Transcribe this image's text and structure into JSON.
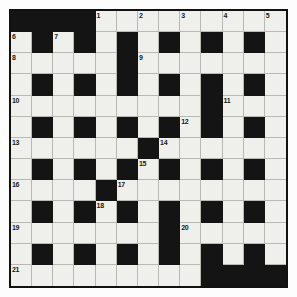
{
  "puzzle": {
    "title": "Crossword Grid",
    "rows": 13,
    "columns": 13,
    "colors": {
      "page_background": "#ffffff",
      "cell_fill": "#efefec",
      "block_fill": "#141414",
      "grid_line": "#b9b9b4",
      "border": "#111111",
      "number_text": "#1a1a1a"
    },
    "legend": {
      "open_cell": "white",
      "blocked_cell": "black"
    },
    "clue_numbers": [
      1,
      2,
      3,
      4,
      5,
      6,
      7,
      8,
      9,
      10,
      11,
      12,
      13,
      14,
      15,
      16,
      17,
      18,
      19,
      20,
      21
    ],
    "grid": [
      [
        {
          "block": true,
          "num": ""
        },
        {
          "block": true,
          "num": ""
        },
        {
          "block": true,
          "num": ""
        },
        {
          "block": true,
          "num": ""
        },
        {
          "block": false,
          "num": "1"
        },
        {
          "block": false,
          "num": ""
        },
        {
          "block": false,
          "num": "2"
        },
        {
          "block": false,
          "num": ""
        },
        {
          "block": false,
          "num": "3"
        },
        {
          "block": false,
          "num": ""
        },
        {
          "block": false,
          "num": "4"
        },
        {
          "block": false,
          "num": ""
        },
        {
          "block": false,
          "num": "5"
        }
      ],
      [
        {
          "block": false,
          "num": "6"
        },
        {
          "block": true,
          "num": ""
        },
        {
          "block": false,
          "num": "7"
        },
        {
          "block": true,
          "num": ""
        },
        {
          "block": false,
          "num": ""
        },
        {
          "block": true,
          "num": ""
        },
        {
          "block": false,
          "num": ""
        },
        {
          "block": true,
          "num": ""
        },
        {
          "block": false,
          "num": ""
        },
        {
          "block": true,
          "num": ""
        },
        {
          "block": false,
          "num": ""
        },
        {
          "block": true,
          "num": ""
        },
        {
          "block": false,
          "num": ""
        }
      ],
      [
        {
          "block": false,
          "num": "8"
        },
        {
          "block": false,
          "num": ""
        },
        {
          "block": false,
          "num": ""
        },
        {
          "block": false,
          "num": ""
        },
        {
          "block": false,
          "num": ""
        },
        {
          "block": true,
          "num": ""
        },
        {
          "block": false,
          "num": "9"
        },
        {
          "block": false,
          "num": ""
        },
        {
          "block": false,
          "num": ""
        },
        {
          "block": false,
          "num": ""
        },
        {
          "block": false,
          "num": ""
        },
        {
          "block": false,
          "num": ""
        },
        {
          "block": false,
          "num": ""
        }
      ],
      [
        {
          "block": false,
          "num": ""
        },
        {
          "block": true,
          "num": ""
        },
        {
          "block": false,
          "num": ""
        },
        {
          "block": true,
          "num": ""
        },
        {
          "block": false,
          "num": ""
        },
        {
          "block": true,
          "num": ""
        },
        {
          "block": false,
          "num": ""
        },
        {
          "block": true,
          "num": ""
        },
        {
          "block": false,
          "num": ""
        },
        {
          "block": true,
          "num": ""
        },
        {
          "block": false,
          "num": ""
        },
        {
          "block": true,
          "num": ""
        },
        {
          "block": false,
          "num": ""
        }
      ],
      [
        {
          "block": false,
          "num": "10"
        },
        {
          "block": false,
          "num": ""
        },
        {
          "block": false,
          "num": ""
        },
        {
          "block": false,
          "num": ""
        },
        {
          "block": false,
          "num": ""
        },
        {
          "block": false,
          "num": ""
        },
        {
          "block": false,
          "num": ""
        },
        {
          "block": false,
          "num": ""
        },
        {
          "block": false,
          "num": ""
        },
        {
          "block": true,
          "num": ""
        },
        {
          "block": false,
          "num": "11"
        },
        {
          "block": false,
          "num": ""
        },
        {
          "block": false,
          "num": ""
        }
      ],
      [
        {
          "block": false,
          "num": ""
        },
        {
          "block": true,
          "num": ""
        },
        {
          "block": false,
          "num": ""
        },
        {
          "block": true,
          "num": ""
        },
        {
          "block": false,
          "num": ""
        },
        {
          "block": true,
          "num": ""
        },
        {
          "block": false,
          "num": ""
        },
        {
          "block": true,
          "num": ""
        },
        {
          "block": false,
          "num": "12"
        },
        {
          "block": true,
          "num": ""
        },
        {
          "block": false,
          "num": ""
        },
        {
          "block": true,
          "num": ""
        },
        {
          "block": false,
          "num": ""
        }
      ],
      [
        {
          "block": false,
          "num": "13"
        },
        {
          "block": false,
          "num": ""
        },
        {
          "block": false,
          "num": ""
        },
        {
          "block": false,
          "num": ""
        },
        {
          "block": false,
          "num": ""
        },
        {
          "block": false,
          "num": ""
        },
        {
          "block": true,
          "num": ""
        },
        {
          "block": false,
          "num": "14"
        },
        {
          "block": false,
          "num": ""
        },
        {
          "block": false,
          "num": ""
        },
        {
          "block": false,
          "num": ""
        },
        {
          "block": false,
          "num": ""
        },
        {
          "block": false,
          "num": ""
        }
      ],
      [
        {
          "block": false,
          "num": ""
        },
        {
          "block": true,
          "num": ""
        },
        {
          "block": false,
          "num": ""
        },
        {
          "block": true,
          "num": ""
        },
        {
          "block": false,
          "num": ""
        },
        {
          "block": true,
          "num": ""
        },
        {
          "block": false,
          "num": "15"
        },
        {
          "block": true,
          "num": ""
        },
        {
          "block": false,
          "num": ""
        },
        {
          "block": true,
          "num": ""
        },
        {
          "block": false,
          "num": ""
        },
        {
          "block": true,
          "num": ""
        },
        {
          "block": false,
          "num": ""
        }
      ],
      [
        {
          "block": false,
          "num": "16"
        },
        {
          "block": false,
          "num": ""
        },
        {
          "block": false,
          "num": ""
        },
        {
          "block": false,
          "num": ""
        },
        {
          "block": true,
          "num": ""
        },
        {
          "block": false,
          "num": "17"
        },
        {
          "block": false,
          "num": ""
        },
        {
          "block": false,
          "num": ""
        },
        {
          "block": false,
          "num": ""
        },
        {
          "block": false,
          "num": ""
        },
        {
          "block": false,
          "num": ""
        },
        {
          "block": false,
          "num": ""
        },
        {
          "block": false,
          "num": ""
        }
      ],
      [
        {
          "block": false,
          "num": ""
        },
        {
          "block": true,
          "num": ""
        },
        {
          "block": false,
          "num": ""
        },
        {
          "block": true,
          "num": ""
        },
        {
          "block": false,
          "num": "18"
        },
        {
          "block": true,
          "num": ""
        },
        {
          "block": false,
          "num": ""
        },
        {
          "block": true,
          "num": ""
        },
        {
          "block": false,
          "num": ""
        },
        {
          "block": true,
          "num": ""
        },
        {
          "block": false,
          "num": ""
        },
        {
          "block": true,
          "num": ""
        },
        {
          "block": false,
          "num": ""
        }
      ],
      [
        {
          "block": false,
          "num": "19"
        },
        {
          "block": false,
          "num": ""
        },
        {
          "block": false,
          "num": ""
        },
        {
          "block": false,
          "num": ""
        },
        {
          "block": false,
          "num": ""
        },
        {
          "block": false,
          "num": ""
        },
        {
          "block": false,
          "num": ""
        },
        {
          "block": true,
          "num": ""
        },
        {
          "block": false,
          "num": "20"
        },
        {
          "block": false,
          "num": ""
        },
        {
          "block": false,
          "num": ""
        },
        {
          "block": false,
          "num": ""
        },
        {
          "block": false,
          "num": ""
        }
      ],
      [
        {
          "block": false,
          "num": ""
        },
        {
          "block": true,
          "num": ""
        },
        {
          "block": false,
          "num": ""
        },
        {
          "block": true,
          "num": ""
        },
        {
          "block": false,
          "num": ""
        },
        {
          "block": true,
          "num": ""
        },
        {
          "block": false,
          "num": ""
        },
        {
          "block": true,
          "num": ""
        },
        {
          "block": false,
          "num": ""
        },
        {
          "block": true,
          "num": ""
        },
        {
          "block": false,
          "num": ""
        },
        {
          "block": true,
          "num": ""
        },
        {
          "block": false,
          "num": ""
        }
      ],
      [
        {
          "block": false,
          "num": "21"
        },
        {
          "block": false,
          "num": ""
        },
        {
          "block": false,
          "num": ""
        },
        {
          "block": false,
          "num": ""
        },
        {
          "block": false,
          "num": ""
        },
        {
          "block": false,
          "num": ""
        },
        {
          "block": false,
          "num": ""
        },
        {
          "block": false,
          "num": ""
        },
        {
          "block": false,
          "num": ""
        },
        {
          "block": true,
          "num": ""
        },
        {
          "block": true,
          "num": ""
        },
        {
          "block": true,
          "num": ""
        },
        {
          "block": true,
          "num": ""
        }
      ]
    ]
  }
}
